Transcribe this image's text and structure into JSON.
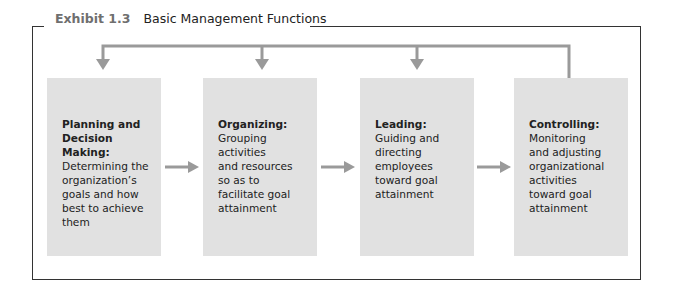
{
  "exhibit": {
    "label": "Exhibit 1.3",
    "title": "Basic Management Functions"
  },
  "colors": {
    "box_fill": "#e1e1e1",
    "arrow": "#9a9a9a",
    "frame": "#333333",
    "label": "#6f6f6f"
  },
  "functions": [
    {
      "title_line1": "Planning and",
      "title_line2": "Decision Making:",
      "desc": [
        "Determining the",
        "organization’s",
        "goals and how",
        "best to achieve",
        "them"
      ]
    },
    {
      "title_line1": "Organizing:",
      "title_line2": "",
      "desc": [
        "Grouping",
        "activities",
        "and resources",
        "so as to",
        "facilitate goal",
        "attainment"
      ]
    },
    {
      "title_line1": "Leading:",
      "title_line2": "",
      "desc": [
        "Guiding and",
        "directing",
        "employees",
        "toward goal",
        "attainment"
      ]
    },
    {
      "title_line1": "Controlling:",
      "title_line2": "",
      "desc": [
        "Monitoring",
        "and adjusting",
        "organizational",
        "activities",
        "toward goal",
        "attainment"
      ]
    }
  ]
}
